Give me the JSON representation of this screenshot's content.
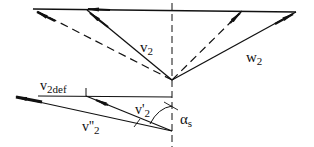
{
  "diagram": {
    "labels": {
      "v2": "v",
      "v2_sub": "2",
      "w2": "w",
      "w2_sub": "2",
      "v2def": "v",
      "v2def_sub": "2def",
      "v2_prime": "v'",
      "v2_prime_sub": "2",
      "v2_dprime": "v''",
      "v2_dprime_sub": "2",
      "alpha_s": "α",
      "alpha_s_sub": "s"
    },
    "colors": {
      "line": "#111111",
      "background": "#ffffff"
    }
  }
}
